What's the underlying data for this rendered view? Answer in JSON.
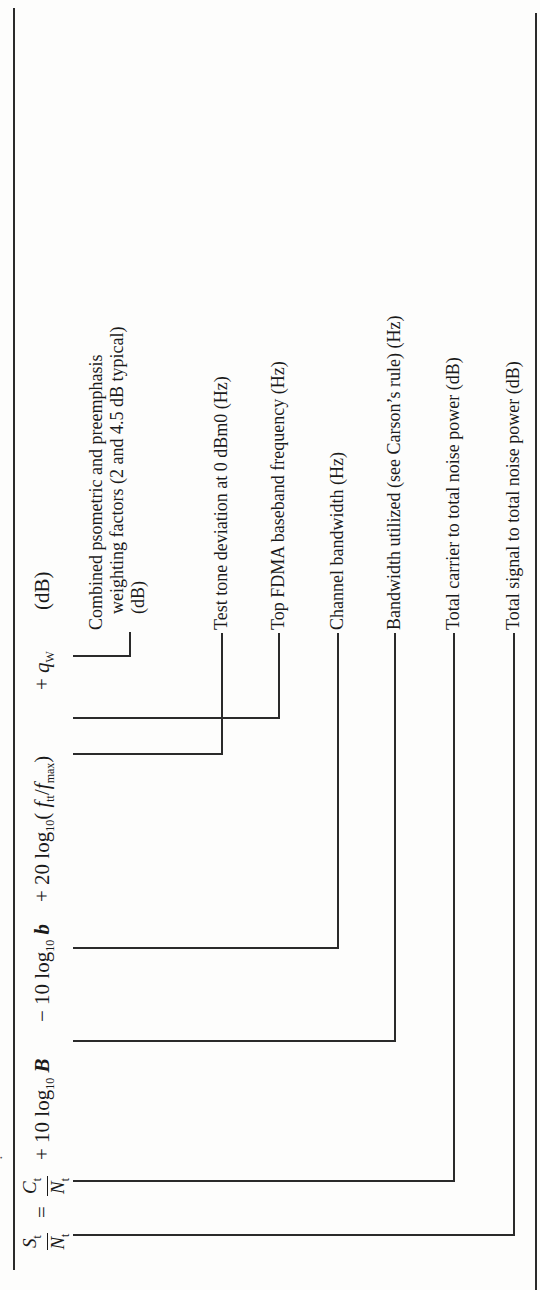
{
  "equation": {
    "lhs_num": "S",
    "lhs_num_sub": "t",
    "lhs_den": "N",
    "lhs_den_sub": "t",
    "equals": "=",
    "term1_num": "C",
    "term1_num_sub": "t",
    "term1_den": "N",
    "term1_den_sub": "t",
    "plus1": "+ 10 log",
    "log_sub": "10",
    "B": "B",
    "minus": "− 10 log",
    "b": "b",
    "plus2": "+ 20 log",
    "paren_open": "(",
    "f_tt": "f",
    "f_tt_sub": "tt",
    "slash": "/",
    "f_max": "f",
    "f_max_sub": "max",
    "paren_close": ")",
    "plus3": "+",
    "q": "q",
    "q_sub": "W",
    "unit": "(dB)"
  },
  "labels": [
    {
      "id": "weighting",
      "lines": [
        "Combined psometric and preemphasis",
        "weighting factors (2 and 4.5 dB typical)",
        "(dB)"
      ]
    },
    {
      "id": "test-tone",
      "text": "Test tone deviation at 0 dBm0 (Hz)"
    },
    {
      "id": "top-fdma",
      "text": "Top FDMA baseband frequency (Hz)"
    },
    {
      "id": "channel-bw",
      "text": "Channel bandwidth (Hz)"
    },
    {
      "id": "bw-utilized",
      "text": "Bandwidth utilized (see Carson’s rule) (Hz)"
    },
    {
      "id": "carrier-noise",
      "text": "Total carrier to total noise power (dB)"
    },
    {
      "id": "signal-noise",
      "text": "Total signal to total noise power (dB)"
    }
  ]
}
